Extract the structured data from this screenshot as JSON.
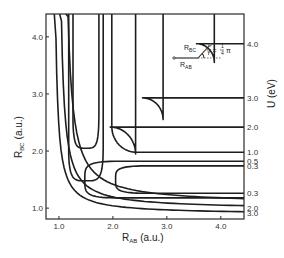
{
  "chart_data": {
    "type": "contour",
    "title": "",
    "xlabel": {
      "main": "R",
      "sub": "AB",
      "unit": "(a.u.)"
    },
    "ylabel": {
      "main": "R",
      "sub": "BC",
      "unit": "(a.u.)"
    },
    "zlabel": "U (eV)",
    "xlim": [
      0.76,
      4.43
    ],
    "ylim": [
      0.81,
      4.4
    ],
    "grid": false,
    "x_ticks": [
      1.0,
      2.0,
      3.0,
      4.0
    ],
    "x_tick_labels": [
      "1.0",
      "2.0",
      "3.0",
      "4.0"
    ],
    "y_ticks": [
      1.0,
      2.0,
      3.0,
      4.0
    ],
    "y_tick_labels": [
      "1.0",
      "2.0",
      "3.0",
      "4.0"
    ],
    "symmetry": "symmetric about R_AB = R_BC",
    "contour_levels_right_edge": [
      {
        "label": "4.0",
        "value": 4.0,
        "y": 3.88
      },
      {
        "label": "3.0",
        "value": 3.0,
        "y": 2.93
      },
      {
        "label": "2.0",
        "value": 2.0,
        "y": 2.42
      },
      {
        "label": "1.0",
        "value": 1.0,
        "y": 1.98
      },
      {
        "label": "0.5",
        "value": 0.5,
        "y": 1.82
      },
      {
        "label": "0.3",
        "value": 0.3,
        "y": 1.74
      },
      {
        "label": "0.3",
        "value": 0.3,
        "y": 1.26
      },
      {
        "label": "2.0",
        "value": 2.0,
        "y": 1.0
      },
      {
        "label": "3.0",
        "value": 3.0,
        "y": 0.91
      }
    ],
    "contours": [
      {
        "level": 4.0,
        "kind": "corner",
        "edge": 3.88,
        "knee": 3.55
      },
      {
        "level": 3.0,
        "kind": "corner",
        "edge": 2.93,
        "knee": 2.55
      },
      {
        "level": 2.0,
        "kind": "corner",
        "edge": 2.42,
        "knee": 1.95
      },
      {
        "level": 1.0,
        "kind": "valley_outer",
        "upper": 1.98,
        "lower": 1.09
      },
      {
        "level": 0.5,
        "kind": "valley_loop",
        "upper": 1.82,
        "lower": 1.18,
        "tip": 1.48
      },
      {
        "level": 0.3,
        "kind": "valley_loop",
        "upper": 1.74,
        "lower": 1.26,
        "tip": 2.05
      },
      {
        "level": 2.0,
        "kind": "inner_corner",
        "edge": 1.0,
        "knee": 1.45
      },
      {
        "level": 3.0,
        "kind": "inner_corner",
        "edge": 0.91,
        "knee": 1.3
      }
    ],
    "inset": {
      "label_bc": {
        "main": "R",
        "sub": "BC"
      },
      "label_ab": {
        "main": "R",
        "sub": "AB"
      },
      "angle_label": "γ = ",
      "angle_frac_num": "1",
      "angle_frac_den": "4",
      "angle_pi": "π"
    }
  }
}
